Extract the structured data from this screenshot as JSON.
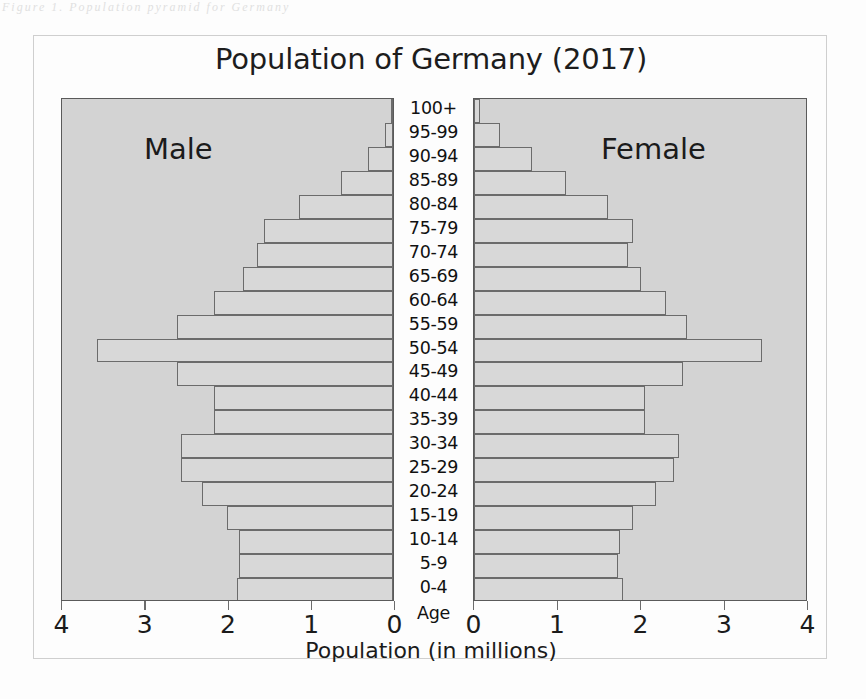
{
  "scan": {
    "top_text": "Figure 1. Population pyramid for Germany"
  },
  "chart_data": {
    "type": "bar",
    "subtype": "population-pyramid",
    "title": "Population of Germany (2017)",
    "xlabel": "Population (in millions)",
    "ylabel": "Age",
    "axis_corner_label": "Age",
    "grid": false,
    "legend_position": "in-plot",
    "xlim_left": [
      4,
      0
    ],
    "xlim_right": [
      0,
      4
    ],
    "xticks_left": [
      "4",
      "3",
      "2",
      "1",
      "0"
    ],
    "xticks_right": [
      "0",
      "1",
      "2",
      "3",
      "4"
    ],
    "xtick_values_left": [
      4,
      3,
      2,
      1,
      0
    ],
    "xtick_values_right": [
      0,
      1,
      2,
      3,
      4
    ],
    "categories": [
      "100+",
      "95-99",
      "90-94",
      "85-89",
      "80-84",
      "75-79",
      "70-74",
      "65-69",
      "60-64",
      "55-59",
      "50-54",
      "45-49",
      "40-44",
      "35-39",
      "30-34",
      "25-29",
      "20-24",
      "15-19",
      "10-14",
      "5-9",
      "0-4"
    ],
    "series": [
      {
        "name": "Male",
        "side": "left",
        "color": "#d8d8d8",
        "values": [
          0.02,
          0.1,
          0.3,
          0.62,
          1.13,
          1.55,
          1.63,
          1.8,
          2.15,
          2.6,
          3.55,
          2.6,
          2.15,
          2.15,
          2.55,
          2.55,
          2.3,
          2.0,
          1.85,
          1.85,
          1.87
        ]
      },
      {
        "name": "Female",
        "side": "right",
        "color": "#d8d8d8",
        "values": [
          0.07,
          0.31,
          0.7,
          1.1,
          1.6,
          1.9,
          1.85,
          2.0,
          2.3,
          2.55,
          3.45,
          2.5,
          2.05,
          2.05,
          2.45,
          2.4,
          2.18,
          1.9,
          1.75,
          1.72,
          1.78
        ]
      }
    ],
    "captions": {
      "male": "Male",
      "female": "Female"
    }
  }
}
